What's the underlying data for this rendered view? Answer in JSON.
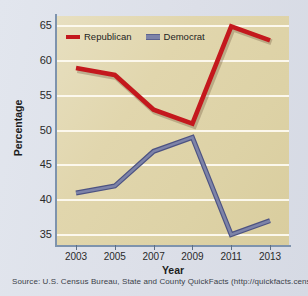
{
  "chart_data": {
    "type": "line",
    "title": "",
    "xlabel": "Year",
    "ylabel": "Percentage",
    "categories": [
      "2003",
      "2005",
      "2007",
      "2009",
      "2011",
      "2013"
    ],
    "x": [
      2003,
      2005,
      2007,
      2009,
      2011,
      2013
    ],
    "xlim": [
      2002,
      2014
    ],
    "ylim": [
      33.5,
      66.5
    ],
    "yticks": [
      35,
      40,
      45,
      50,
      55,
      60,
      65
    ],
    "ytick_labels": [
      "35",
      "40",
      "45",
      "50",
      "55",
      "60",
      "65"
    ],
    "xtick_labels": [
      "2003",
      "2005",
      "2007",
      "2009",
      "2011",
      "2013"
    ],
    "grid": true,
    "grid_axis": "y",
    "legend_position": "upper-left-inside",
    "series": [
      {
        "name": "Republican",
        "color": "#c4181d",
        "values": [
          59,
          58,
          53,
          51,
          65,
          63
        ]
      },
      {
        "name": "Democrat",
        "color": "#7d83a8",
        "values": [
          41,
          42,
          47,
          49,
          35,
          37
        ]
      }
    ]
  },
  "legend": {
    "entries": [
      {
        "label": "Republican",
        "color": "#c4181d"
      },
      {
        "label": "Democrat",
        "color": "#7d83a8"
      }
    ]
  },
  "axes": {
    "y_title": "Percentage",
    "x_title": "Year"
  },
  "source": {
    "text": "Source: U.S. Census Bureau, State and County QuickFacts (http://quickfacts.census.gov)"
  },
  "colors": {
    "plot_background": "#e1d6ad",
    "page_background": "#dfe3ec",
    "gridline": "#fdfaf0",
    "axis": "#7e93ad",
    "republican": "#c4181d",
    "democrat": "#7d83a8"
  }
}
